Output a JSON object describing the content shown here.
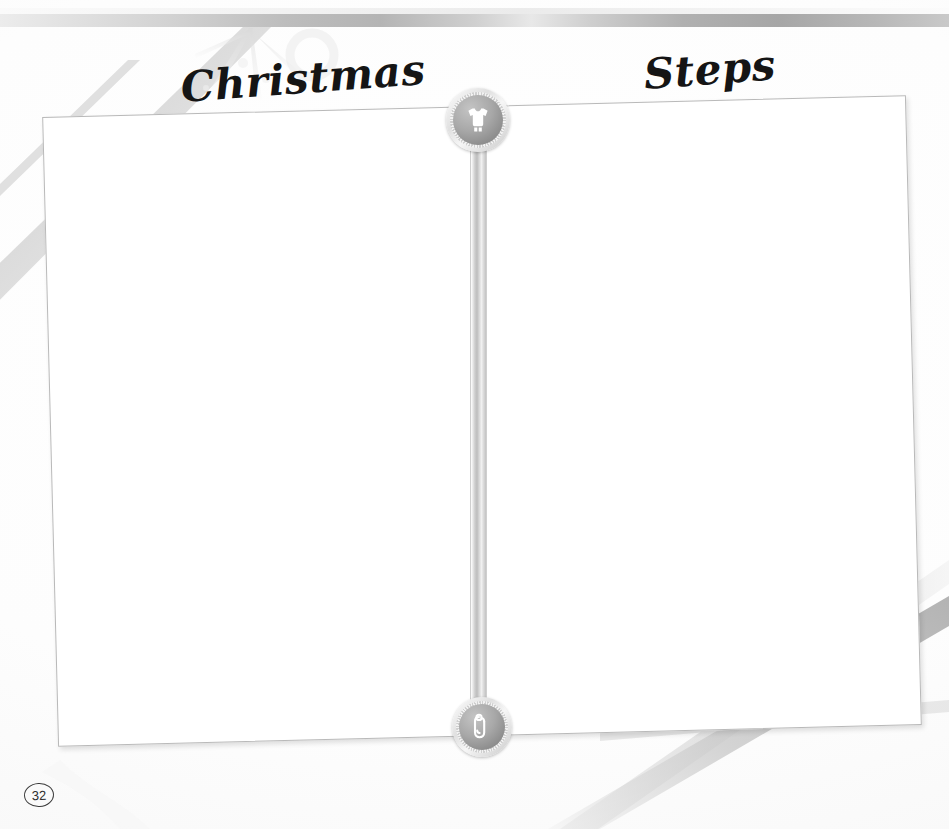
{
  "page": {
    "title_left": "Christmas",
    "title_right": "Steps",
    "page_number": "32",
    "ghost_watermark": "baby first christmas first steps memories"
  },
  "badges": {
    "top": {
      "icon": "baby-onesie-icon",
      "label": "Christmas section marker"
    },
    "bottom": {
      "icon": "safety-pin-icon",
      "label": "Steps section marker"
    }
  },
  "layout": {
    "left_panel_label": "Christmas photo area",
    "right_panel_label": "Steps photo area",
    "divider_label": "center divider pole"
  },
  "colors": {
    "band_dark": "#a6a6a6",
    "band_light": "#ececec",
    "frame_border": "#b9b9b9",
    "badge_disc": "#9a9a9a",
    "ink": "#151515",
    "paper": "#ffffff"
  }
}
